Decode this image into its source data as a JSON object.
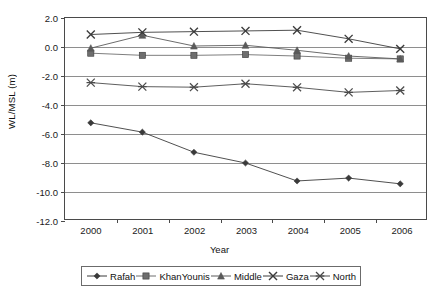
{
  "chart_data": {
    "type": "line",
    "title": "",
    "xlabel": "Year",
    "ylabel": "WL/MSL (m)",
    "categories": [
      "2000",
      "2001",
      "2002",
      "2003",
      "2004",
      "2005",
      "2006"
    ],
    "ylim": [
      -12.0,
      2.0
    ],
    "yticks": [
      "2.0",
      "0.0",
      "-2.0",
      "-4.0",
      "-6.0",
      "-8.0",
      "-10.0",
      "-12.0"
    ],
    "ytick_values": [
      2.0,
      0.0,
      -2.0,
      -4.0,
      -6.0,
      -8.0,
      -10.0,
      -12.0
    ],
    "grid": true,
    "legend_position": "bottom",
    "series": [
      {
        "name": "Rafah",
        "marker": "diamond",
        "color": "#3a3a3a",
        "values": [
          -5.3,
          -5.95,
          -7.35,
          -8.1,
          -9.35,
          -9.15,
          -9.55
        ]
      },
      {
        "name": "KhanYounis",
        "marker": "square",
        "color": "#6e6e6e",
        "values": [
          -0.45,
          -0.6,
          -0.6,
          -0.55,
          -0.65,
          -0.8,
          -0.85
        ]
      },
      {
        "name": "Middle",
        "marker": "triangle",
        "color": "#5a5a5a",
        "values": [
          -0.1,
          0.8,
          0.05,
          0.1,
          -0.25,
          -0.65,
          -0.85
        ]
      },
      {
        "name": "Gaza",
        "marker": "cross",
        "color": "#3a3a3a",
        "values": [
          0.85,
          1.0,
          1.05,
          1.1,
          1.15,
          0.55,
          -0.15
        ]
      },
      {
        "name": "North",
        "marker": "asterisk",
        "color": "#4a4a4a",
        "values": [
          -2.5,
          -2.78,
          -2.82,
          -2.58,
          -2.83,
          -3.18,
          -3.05
        ]
      }
    ]
  }
}
